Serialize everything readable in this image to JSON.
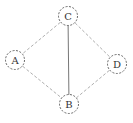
{
  "diagram": {
    "type": "undirected-graph",
    "nodes": [
      {
        "id": "C",
        "label": "C",
        "x": 68,
        "y": 16
      },
      {
        "id": "A",
        "label": "A",
        "x": 15,
        "y": 60
      },
      {
        "id": "D",
        "label": "D",
        "x": 117,
        "y": 64
      },
      {
        "id": "B",
        "label": "B",
        "x": 69,
        "y": 104
      }
    ],
    "edges": [
      {
        "from": "C",
        "to": "A",
        "style": "dashed"
      },
      {
        "from": "C",
        "to": "D",
        "style": "dashed"
      },
      {
        "from": "C",
        "to": "B",
        "style": "solid"
      },
      {
        "from": "A",
        "to": "B",
        "style": "dashed"
      },
      {
        "from": "D",
        "to": "B",
        "style": "dashed"
      }
    ],
    "colors": {
      "edge": "#888888",
      "edge_solid": "#777777",
      "node_stroke": "#555555",
      "label": "#333333"
    }
  }
}
